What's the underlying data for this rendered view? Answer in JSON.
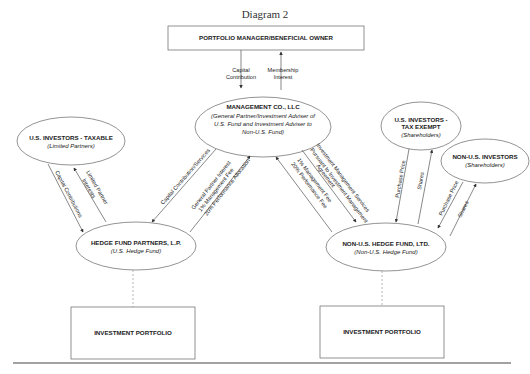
{
  "title": "Diagram 2",
  "nodes": {
    "portfolio_manager": {
      "label": "PORTFOLIO MANAGER/BENEFICIAL OWNER"
    },
    "management_co": {
      "label": "MANAGEMENT CO., LLC",
      "sub1": "(General Partner/Investment Adviser of",
      "sub2": "U.S. Fund and Investment Adviser to",
      "sub3": "Non-U.S. Fund)"
    },
    "us_taxable": {
      "label": "U.S. INVESTORS - TAXABLE",
      "sub": "(Limited Partners)"
    },
    "us_tax_exempt": {
      "label1": "U.S. INVESTORS -",
      "label2": "TAX EXEMPT",
      "sub": "(Shareholders)"
    },
    "non_us_investors": {
      "label": "NON-U.S. INVESTORS",
      "sub": "(Shareholders)"
    },
    "hedge_fund_lp": {
      "label": "HEDGE FUND PARTNERS, L.P.",
      "sub": "(U.S. Hedge Fund)"
    },
    "non_us_fund": {
      "label": "NON-U.S. HEDGE FUND, LTD.",
      "sub": "(Non-U.S. Hedge Fund)"
    },
    "portfolio_left": {
      "label": "INVESTMENT PORTFOLIO"
    },
    "portfolio_right": {
      "label": "INVESTMENT PORTFOLIO"
    }
  },
  "edges": {
    "capital_contribution_1": "Capital",
    "capital_contribution_2": "Contribution",
    "membership_1": "Membership",
    "membership_2": "Interest",
    "taxable_capital": "Capital Contributions",
    "lp_interests_1": "Limited Partner",
    "lp_interests_2": "Interests",
    "lp_capital_services": "Capital Contribution/Services",
    "gp_interest": "General Partner Interest",
    "gp_mgmt_fee": "1% Management Fee",
    "gp_perf_alloc": "20% Performance Allocation",
    "nonus_mgmt_fee": "1% Management Fee",
    "nonus_perf_fee": "20% Performance Fee",
    "ims_1": "Investment Management Services",
    "ims_2": "Pursuant to Investment Management",
    "ims_3": "Agreement",
    "exempt_purchase": "Purchase Price",
    "exempt_shares": "Shares",
    "nonus_purchase": "Purchase Price",
    "nonus_shares": "Shares"
  }
}
